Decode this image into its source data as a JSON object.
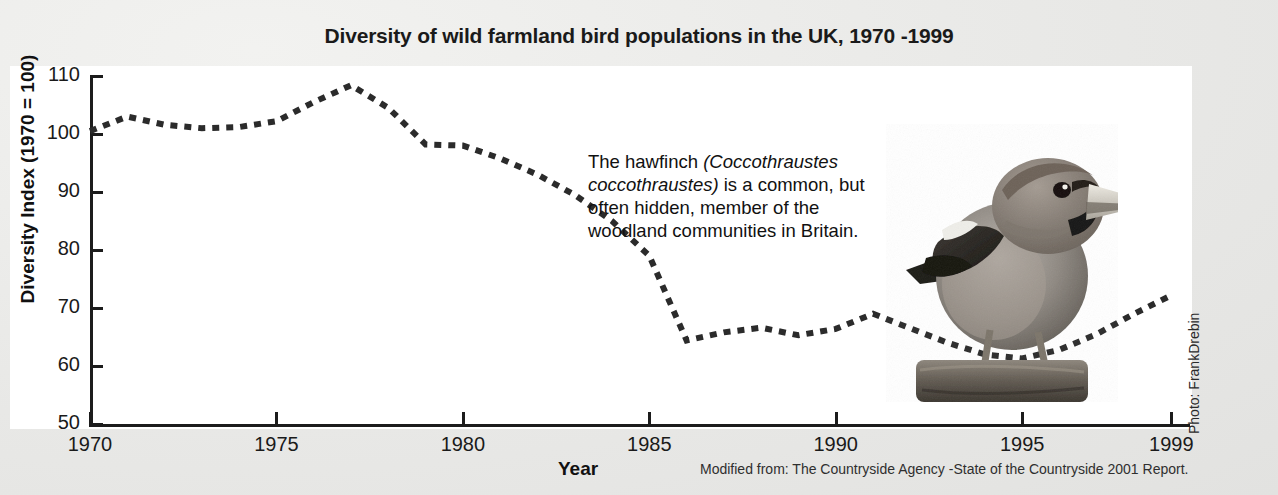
{
  "title": "Diversity of wild farmland bird populations in the UK, 1970 -1999",
  "annotation": {
    "text_part1": "The hawfinch ",
    "scientific_name": "(Coccothraustes coccothraustes)",
    "text_part2": " is a common, but often hidden, member of the woodland communities in Britain."
  },
  "photo_credit": "Photo: FrankDrebin",
  "source_note": "Modified from: The Countryside Agency -State of the Countryside 2001 Report.",
  "photo": {
    "subject": "hawfinch-perched-on-branch",
    "style": "grayscale-photograph"
  },
  "colors": {
    "background": "#e9e9e7",
    "panel": "#ffffff",
    "ink": "#1c1c1c",
    "series": "#2b2b2b"
  },
  "chart_data": {
    "type": "line",
    "title": "Diversity of wild farmland bird populations in the UK, 1970 -1999",
    "xlabel": "Year",
    "ylabel": "Diversity Index (1970 = 100)",
    "xlim": [
      1970,
      1999.5
    ],
    "ylim": [
      50,
      110
    ],
    "xticks": [
      1970,
      1975,
      1980,
      1985,
      1990,
      1995,
      1999
    ],
    "yticks": [
      50,
      60,
      70,
      80,
      90,
      100,
      110
    ],
    "grid": false,
    "legend": null,
    "line_style": "dotted",
    "series": [
      {
        "name": "Diversity Index",
        "x": [
          1970,
          1971,
          1972,
          1973,
          1974,
          1975,
          1976,
          1977,
          1978,
          1979,
          1980,
          1981,
          1982,
          1983,
          1984,
          1985,
          1986,
          1987,
          1988,
          1989,
          1990,
          1991,
          1992,
          1993,
          1994,
          1995,
          1996,
          1997,
          1998,
          1999
        ],
        "values": [
          100.5,
          103.0,
          101.6,
          101.0,
          101.2,
          102.2,
          105.5,
          108.4,
          104.5,
          98.2,
          98.0,
          95.8,
          93.0,
          89.5,
          85.0,
          79.0,
          64.4,
          65.8,
          66.6,
          65.3,
          66.4,
          69.0,
          66.5,
          64.0,
          62.0,
          61.3,
          62.8,
          65.5,
          69.0,
          72.2
        ]
      }
    ]
  }
}
